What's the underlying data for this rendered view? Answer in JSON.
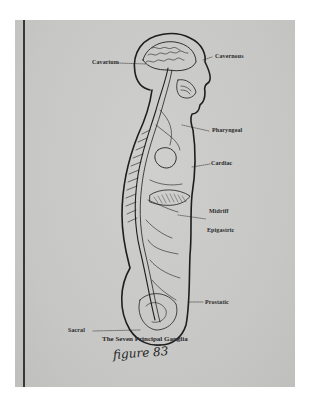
{
  "figure": {
    "caption": "The Seven Principal Ganglia",
    "handwritten_note": "figure 83",
    "labels": [
      {
        "id": "cavarium",
        "text": "Cavarium"
      },
      {
        "id": "cavernous",
        "text": "Cavernous"
      },
      {
        "id": "pharyngeal",
        "text": "Pharyngeal"
      },
      {
        "id": "cardiac",
        "text": "Cardiac"
      },
      {
        "id": "midriff",
        "text": "Midriff"
      },
      {
        "id": "epigastric",
        "text": "Epigastric"
      },
      {
        "id": "prostatic",
        "text": "Prostatic"
      },
      {
        "id": "sacral",
        "text": "Sacral"
      }
    ]
  },
  "colors": {
    "paper": "#ffffff",
    "print": "#c9c9c7",
    "ink": "#1e1e1e"
  }
}
